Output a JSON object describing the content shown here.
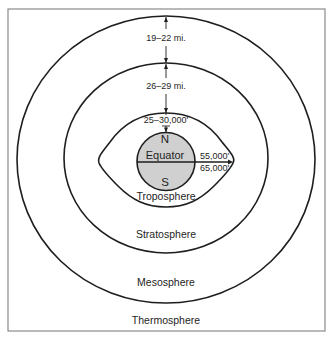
{
  "diagram": {
    "colors": {
      "line": "#1e1e1e",
      "border": "#8a8a8a",
      "earth_fill": "#d0d0d0",
      "background": "#ffffff"
    },
    "layers": [
      {
        "name": "Troposphere",
        "label": "Troposphere"
      },
      {
        "name": "Stratosphere",
        "label": "Stratosphere"
      },
      {
        "name": "Mesosphere",
        "label": "Mesosphere"
      },
      {
        "name": "Thermosphere",
        "label": "Thermosphere"
      }
    ],
    "earth": {
      "north_label": "N",
      "south_label": "S",
      "equator_label": "Equator"
    },
    "measurements": {
      "mesosphere_thickness": "19–22 mi.",
      "stratosphere_thickness": "26–29 mi.",
      "troposphere_polar_height": "25–30,000'",
      "troposphere_equator_height_min": "55,000'",
      "troposphere_equator_height_max": "65,000'"
    }
  }
}
